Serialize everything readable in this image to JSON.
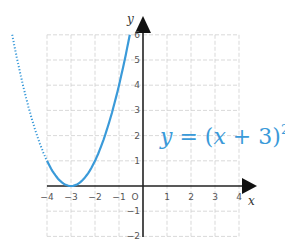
{
  "chart_data": {
    "type": "line",
    "title": "",
    "xlabel": "x",
    "ylabel": "y",
    "xlim": [
      -4,
      4
    ],
    "ylim": [
      -2,
      6
    ],
    "grid": true,
    "grid_style": "dashed",
    "x_ticks": [
      "−4",
      "−3",
      "−2",
      "−1",
      "O",
      "1",
      "2",
      "3",
      "4"
    ],
    "y_ticks": [
      "6",
      "5",
      "4",
      "3",
      "2",
      "1",
      "−1",
      "−2"
    ],
    "annotation": {
      "lhs": "y",
      "eq": " = (",
      "var": "x",
      "rest": " + 3)",
      "exp": "2"
    },
    "series": [
      {
        "name": "y = (x + 3)^2",
        "style": "solid",
        "color": "#3a9ad9",
        "x": [
          -4,
          -3.5,
          -3,
          -2.5,
          -2,
          -1.5,
          -1,
          -0.55
        ],
        "y": [
          1,
          0.25,
          0,
          0.25,
          1,
          2.25,
          4,
          6
        ]
      },
      {
        "name": "y = (x + 3)^2 (extension)",
        "style": "dotted",
        "color": "#3a9ad9",
        "x": [
          -5.45,
          -5,
          -4.5,
          -4
        ],
        "y": [
          6,
          4,
          2.25,
          1
        ]
      }
    ]
  },
  "colors": {
    "curve": "#3a9ad9",
    "axis": "#222222",
    "grid": "#cfcfcf"
  }
}
